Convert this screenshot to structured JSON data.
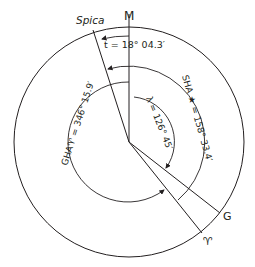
{
  "diagram": {
    "colors": {
      "stroke": "#231f20",
      "background": "#ffffff"
    },
    "labels": {
      "meridian": "M",
      "star": "Spica",
      "greenwich": "G",
      "aries": "♈",
      "t": "t = 18° 04.3′",
      "sha": "SHA ★ = 158° 33.4′",
      "gha_aries": "GHA♈ = 346° 15.9′",
      "lambda": "λ = 126° 45′"
    },
    "values": {
      "t_deg": 18.07,
      "sha_deg": 158.56,
      "gha_aries_deg": 346.27,
      "lambda_deg": 126.75
    }
  }
}
